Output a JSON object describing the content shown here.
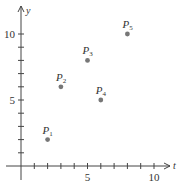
{
  "chart_data": {
    "type": "scatter",
    "title": "",
    "xlabel": "t",
    "ylabel": "y",
    "xlim": [
      -1,
      11.5
    ],
    "ylim": [
      -1,
      11.5
    ],
    "x_ticks": [
      1,
      2,
      3,
      4,
      5,
      6,
      7,
      8,
      9,
      10
    ],
    "y_ticks": [
      1,
      2,
      3,
      4,
      5,
      6,
      7,
      8,
      9,
      10
    ],
    "x_tick_labels": [
      {
        "value": 5,
        "label": "5"
      },
      {
        "value": 10,
        "label": "10"
      }
    ],
    "y_tick_labels": [
      {
        "value": 5,
        "label": "5"
      },
      {
        "value": 10,
        "label": "10"
      }
    ],
    "grid": false,
    "legend": null,
    "points": [
      {
        "label": "P",
        "sub": "1",
        "x": 2,
        "y": 2
      },
      {
        "label": "P",
        "sub": "2",
        "x": 3,
        "y": 6
      },
      {
        "label": "P",
        "sub": "3",
        "x": 5,
        "y": 8
      },
      {
        "label": "P",
        "sub": "4",
        "x": 6,
        "y": 5
      },
      {
        "label": "P",
        "sub": "5",
        "x": 8,
        "y": 10
      }
    ],
    "colors": {
      "axis": "#444444",
      "point": "#777777",
      "text": "#333333"
    }
  }
}
